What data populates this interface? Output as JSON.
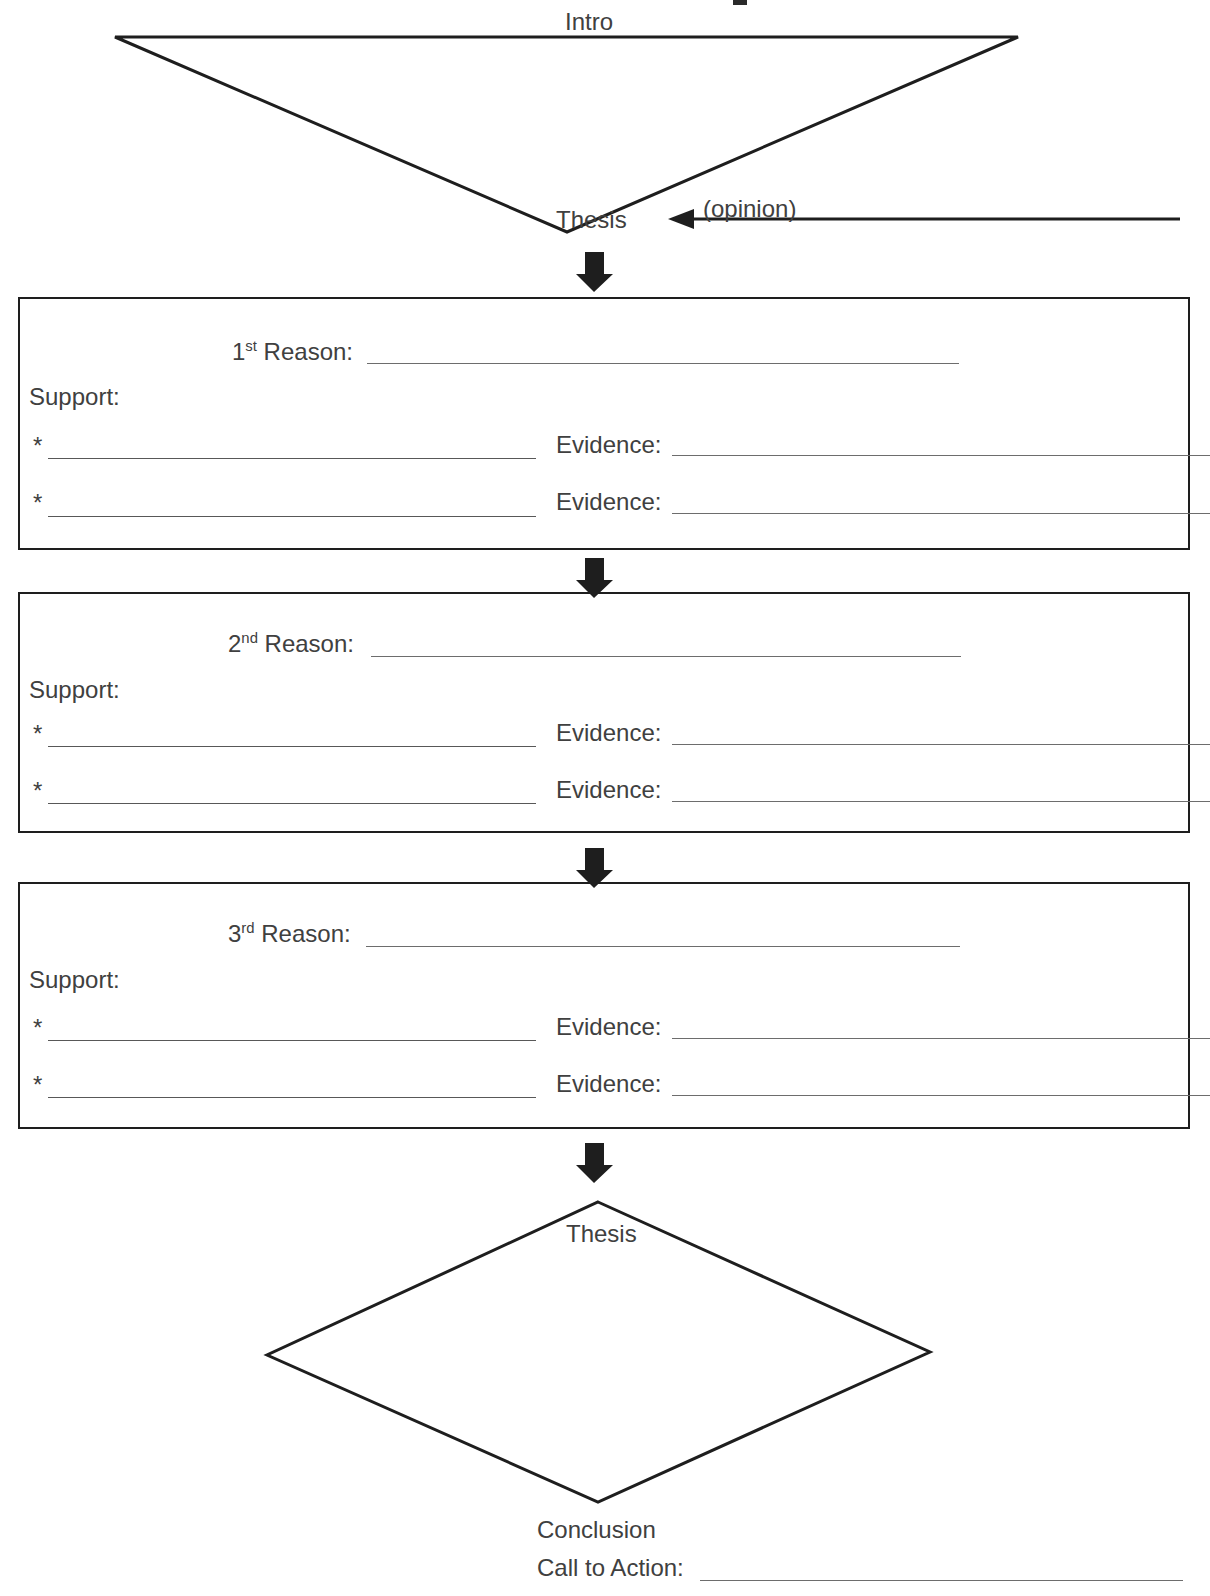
{
  "document": {
    "type": "graphic-organizer",
    "title": "Argumentative Essay Graphic Organizer"
  },
  "intro": {
    "shape": "inverted-triangle",
    "label": "Intro",
    "thesis_label": "Thesis",
    "opinion_label": "(opinion)"
  },
  "body_sections": [
    {
      "reason_number": "1",
      "reason_ordinal_suffix": "st",
      "reason_label": "Reason:",
      "support_label": "Support:",
      "bullets": [
        {
          "marker": "*",
          "evidence_label": "Evidence:"
        },
        {
          "marker": "*",
          "evidence_label": "Evidence:"
        }
      ]
    },
    {
      "reason_number": "2",
      "reason_ordinal_suffix": "nd",
      "reason_label": "Reason:",
      "support_label": "Support:",
      "bullets": [
        {
          "marker": "*",
          "evidence_label": "Evidence:"
        },
        {
          "marker": "*",
          "evidence_label": "Evidence:"
        }
      ]
    },
    {
      "reason_number": "3",
      "reason_ordinal_suffix": "rd",
      "reason_label": "Reason:",
      "support_label": "Support:",
      "bullets": [
        {
          "marker": "*",
          "evidence_label": "Evidence:"
        },
        {
          "marker": "*",
          "evidence_label": "Evidence:"
        }
      ]
    }
  ],
  "conclusion": {
    "shape": "diamond",
    "thesis_label": "Thesis",
    "conclusion_label": "Conclusion",
    "call_to_action_label": "Call to Action:"
  },
  "colors": {
    "ink": "#1e1e1e",
    "text": "#404040",
    "rule": "#6d6d6d",
    "page": "#ffffff"
  }
}
